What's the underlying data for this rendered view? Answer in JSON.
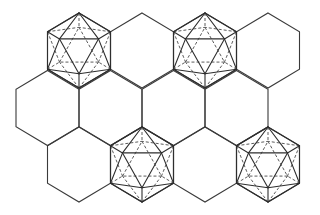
{
  "diagram": {
    "width": 320,
    "height": 215,
    "colors": {
      "background": "#ffffff",
      "line": "#3a3a3a",
      "hidden_line": "#4a4a4a"
    },
    "hexagon": {
      "half_width": 31.5,
      "radius": 37.5,
      "orientation": "pointy-top"
    },
    "rows": [
      {
        "name": "top",
        "y": 50.5,
        "centers_x": [
          79,
          142,
          205,
          268
        ]
      },
      {
        "name": "middle",
        "y": 108,
        "centers_x": [
          47.5,
          110.5,
          173.5,
          236.5
        ]
      },
      {
        "name": "bottom",
        "y": 164.5,
        "centers_x": [
          79,
          142,
          205,
          268
        ]
      }
    ],
    "icosahedra": [
      {
        "row": "top",
        "x": 79,
        "y": 50.5
      },
      {
        "row": "top",
        "x": 205,
        "y": 50.5
      },
      {
        "row": "bottom",
        "x": 142,
        "y": 164.5
      },
      {
        "row": "bottom",
        "x": 268,
        "y": 164.5
      }
    ],
    "icosahedron_projection": {
      "view": "3-fold axis",
      "inner_scale": 0.618,
      "front_triangle": [
        "upper-right",
        "upper-left",
        "bottom"
      ],
      "back_triangle": [
        "top",
        "lower-right",
        "lower-left"
      ]
    }
  }
}
